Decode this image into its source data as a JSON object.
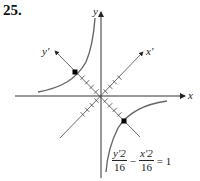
{
  "problem_number": "25.",
  "axes": {
    "x_label": "x",
    "y_label": "y",
    "x_prime_label": "x′",
    "y_prime_label": "y′"
  },
  "equation": {
    "term1_num": "y′2",
    "term1_den": "16",
    "operator": "−",
    "term2_num": "x′2",
    "term2_den": "16",
    "rhs": "= 1"
  },
  "colors": {
    "curve": "#555555",
    "axis": "#333333",
    "vertex": "#000000"
  }
}
